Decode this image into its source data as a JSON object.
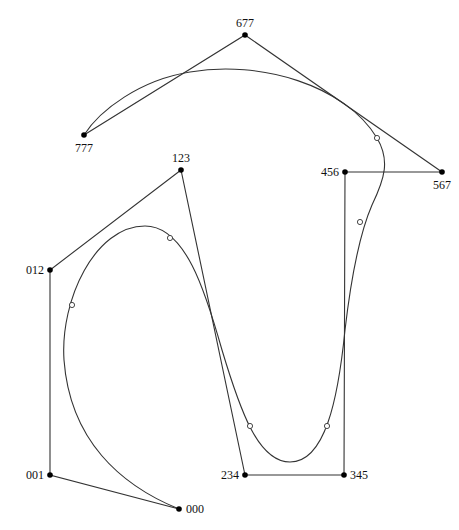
{
  "diagram": {
    "type": "control-polygon-with-spline-curve",
    "control_points": [
      {
        "label": "000"
      },
      {
        "label": "001"
      },
      {
        "label": "012"
      },
      {
        "label": "123"
      },
      {
        "label": "234"
      },
      {
        "label": "345"
      },
      {
        "label": "456"
      },
      {
        "label": "567"
      },
      {
        "label": "677"
      },
      {
        "label": "777"
      }
    ],
    "curve_knot_markers": 6,
    "colors": {
      "line": "#333333",
      "control_point": "#000000",
      "knot_fill": "#ffffff"
    }
  }
}
